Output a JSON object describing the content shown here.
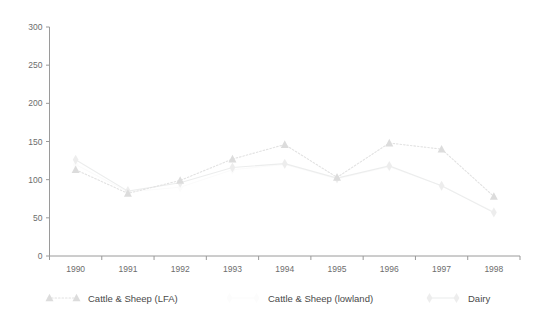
{
  "chart_data": {
    "type": "line",
    "title": "",
    "xlabel": "",
    "ylabel": "",
    "categories": [
      "1990",
      "1991",
      "1992",
      "1993",
      "1994",
      "1995",
      "1996",
      "1997",
      "1998"
    ],
    "x": [
      1990,
      1991,
      1992,
      1993,
      1994,
      1995,
      1996,
      1997,
      1998
    ],
    "ylim": [
      0,
      300
    ],
    "xlim": [
      1989.5,
      1998.5
    ],
    "yticks": [
      0,
      50,
      100,
      150,
      200,
      250,
      300
    ],
    "ytick_labels": [
      "0",
      "50",
      "100",
      "150",
      "200",
      "250",
      "300"
    ],
    "xtick_labels": [
      "1990",
      "1991",
      "1992",
      "1993",
      "1994",
      "1995",
      "1996",
      "1997",
      "1998"
    ],
    "grid": false,
    "legend_position": "bottom",
    "series": [
      {
        "name": "Cattle & Sheep (LFA)",
        "marker": "triangle",
        "linestyle": "dotted",
        "color": "#dcdcdc",
        "values": [
          113,
          82,
          99,
          127,
          146,
          103,
          148,
          140,
          78
        ]
      },
      {
        "name": "Cattle & Sheep (lowland)",
        "marker": "diamond",
        "linestyle": "solid",
        "color": "#fcfcfc",
        "values": [
          120,
          84,
          90,
          113,
          120,
          101,
          117,
          92,
          58
        ]
      },
      {
        "name": "Dairy",
        "marker": "diamond",
        "linestyle": "solid",
        "color": "#ededed",
        "values": [
          126,
          85,
          96,
          116,
          121,
          102,
          118,
          92,
          57
        ]
      }
    ]
  },
  "legend": {
    "items": [
      {
        "label": "Cattle & Sheep (LFA)"
      },
      {
        "label": "Cattle & Sheep (lowland)"
      },
      {
        "label": "Dairy"
      }
    ]
  },
  "colors": {
    "axis": "#9a9a9a",
    "tick_text": "#6d6d6d",
    "legend_text": "#4a4a4a",
    "background": "#ffffff",
    "series_lfa": "#dcdcdc",
    "series_lowland": "#fcfcfc",
    "series_dairy": "#ededed"
  }
}
